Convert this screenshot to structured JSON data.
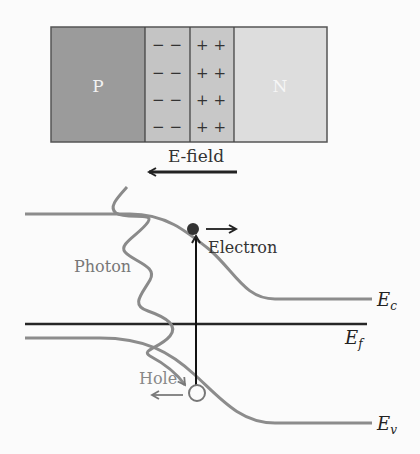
{
  "junction": {
    "p_label": "P",
    "n_label": "N",
    "neg_charges": [
      "− −",
      "− −",
      "− −",
      "− −"
    ],
    "pos_charges": [
      "+ +",
      "+ +",
      "+ +",
      "+ +"
    ],
    "colors": {
      "p_region": "#9a9a9a",
      "depletion": "#c6c6c6",
      "n_region": "#dcdcdc",
      "border": "#444444"
    }
  },
  "efield": {
    "label": "E-field"
  },
  "band_diagram": {
    "photon_label": "Photon",
    "electron_label": "Electron",
    "hole_label": "Hole",
    "ec_label": "E",
    "ec_sub": "c",
    "ef_label": "E",
    "ef_sub": "f",
    "ev_label": "E",
    "ev_sub": "v",
    "colors": {
      "band": "#8a8a8a",
      "fermi": "#222222",
      "transition": "#111111"
    }
  }
}
